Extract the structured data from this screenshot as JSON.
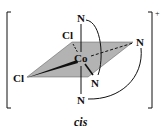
{
  "diagram": {
    "metal": "Co",
    "charge": "+",
    "caption": "cis",
    "ligands": {
      "top_axial": "N",
      "bottom_axial": "N",
      "plane_back_left": "Cl",
      "plane_left": "Cl",
      "plane_right": "N",
      "plane_front": "N"
    },
    "colors": {
      "plane_fill": "#b3b3b3",
      "line": "#111111"
    }
  }
}
